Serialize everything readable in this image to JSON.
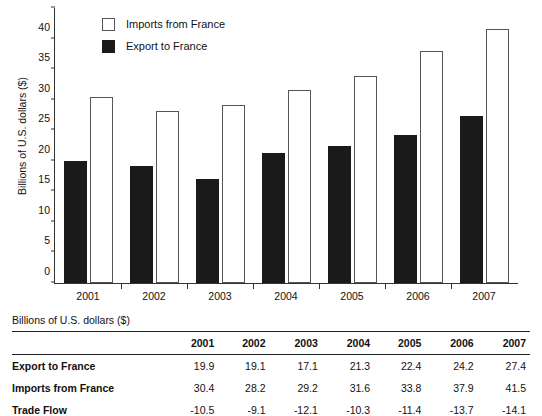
{
  "chart_data": {
    "type": "bar",
    "title": "",
    "xlabel": "",
    "ylabel": "Billions of U.S. dollars ($)",
    "categories": [
      "2001",
      "2002",
      "2003",
      "2004",
      "2005",
      "2006",
      "2007"
    ],
    "series": [
      {
        "name": "Export to France",
        "values": [
          19.9,
          19.1,
          17.1,
          21.3,
          22.4,
          24.2,
          27.4
        ],
        "color": "#1a1a1a",
        "style": "filled"
      },
      {
        "name": "Imports from France",
        "values": [
          30.4,
          28.2,
          29.2,
          31.6,
          33.8,
          37.9,
          41.5
        ],
        "color": "#ffffff",
        "style": "outlined"
      }
    ],
    "ylim": [
      0,
      45
    ],
    "ytick_step": 5,
    "yticks": [
      0,
      5,
      10,
      15,
      20,
      25,
      30,
      35,
      40,
      45
    ],
    "grid": false,
    "legend_position": "top-left-inside",
    "legend_order": [
      "Imports from France",
      "Export to France"
    ],
    "bar_order_in_group": [
      "Export to France",
      "Imports from France"
    ]
  },
  "legend": {
    "items": [
      {
        "label": "Imports from France",
        "swatch": "imports"
      },
      {
        "label": "Export to France",
        "swatch": "export"
      }
    ]
  },
  "table": {
    "caption": "Billions of U.S. dollars ($)",
    "corner_header": "",
    "column_headers": [
      "2001",
      "2002",
      "2003",
      "2004",
      "2005",
      "2006",
      "2007"
    ],
    "rows": [
      {
        "label": "Export to France",
        "values": [
          "19.9",
          "19.1",
          "17.1",
          "21.3",
          "22.4",
          "24.2",
          "27.4"
        ]
      },
      {
        "label": "Imports from France",
        "values": [
          "30.4",
          "28.2",
          "29.2",
          "31.6",
          "33.8",
          "37.9",
          "41.5"
        ]
      },
      {
        "label": "Trade Flow",
        "values": [
          "-10.5",
          "-9.1",
          "-12.1",
          "-10.3",
          "-11.4",
          "-13.7",
          "-14.1"
        ]
      }
    ]
  }
}
